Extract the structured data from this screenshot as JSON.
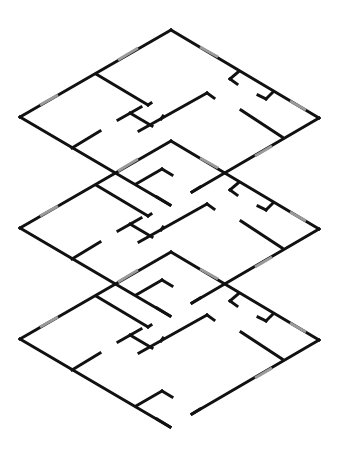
{
  "diagram": {
    "title": "Stacked isometric floor plans",
    "floor_count": 3,
    "floor_offset_y": 111,
    "colors": {
      "background": "#ffffff",
      "wall": "#111111",
      "window": "#9a9a9a"
    },
    "floors": [
      {
        "label": "Floor 3 (top)",
        "index": 0
      },
      {
        "label": "Floor 2 (middle)",
        "index": 1
      },
      {
        "label": "Floor 1 (bottom)",
        "index": 2
      }
    ],
    "walls": [
      [
        [
          20,
          117
        ],
        [
          171,
          30
        ]
      ],
      [
        [
          171,
          30
        ],
        [
          319,
          118
        ]
      ],
      [
        [
          319,
          118
        ],
        [
          192,
          192
        ]
      ],
      [
        [
          20,
          117
        ],
        [
          170,
          205
        ]
      ],
      [
        [
          96,
          74
        ],
        [
          148,
          105
        ]
      ],
      [
        [
          148,
          105
        ],
        [
          151,
          103
        ]
      ],
      [
        [
          118,
          120
        ],
        [
          141,
          107
        ]
      ],
      [
        [
          130,
          113
        ],
        [
          152,
          126
        ]
      ],
      [
        [
          139,
          131
        ],
        [
          207,
          93
        ]
      ],
      [
        [
          207,
          93
        ],
        [
          214,
          98
        ]
      ],
      [
        [
          161,
          119
        ],
        [
          163,
          116
        ]
      ],
      [
        [
          72,
          148
        ],
        [
          100,
          131
        ]
      ],
      [
        [
          238,
          72
        ],
        [
          230,
          79
        ]
      ],
      [
        [
          230,
          79
        ],
        [
          237,
          84
        ]
      ],
      [
        [
          273,
          92
        ],
        [
          266,
          99
        ]
      ],
      [
        [
          266,
          99
        ],
        [
          258,
          95
        ]
      ],
      [
        [
          241,
          110
        ],
        [
          282,
          137
        ]
      ],
      [
        [
          136,
          184
        ],
        [
          162,
          169
        ]
      ],
      [
        [
          162,
          169
        ],
        [
          172,
          175
        ]
      ],
      [
        [
          157,
          197
        ],
        [
          170,
          205
        ]
      ],
      [
        [
          192,
          192
        ],
        [
          200,
          187
        ]
      ]
    ],
    "windows": [
      [
        [
          40,
          105
        ],
        [
          58,
          95
        ]
      ],
      [
        [
          118,
          60
        ],
        [
          138,
          48
        ]
      ],
      [
        [
          200,
          47
        ],
        [
          218,
          57
        ]
      ],
      [
        [
          290,
          101
        ],
        [
          306,
          110
        ]
      ],
      [
        [
          255,
          156
        ],
        [
          272,
          146
        ]
      ]
    ]
  }
}
